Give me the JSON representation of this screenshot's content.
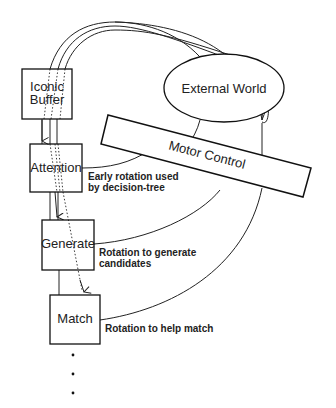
{
  "diagram": {
    "boxes": [
      {
        "id": "iconic-buffer",
        "lines": [
          "Iconic",
          "Buffer"
        ]
      },
      {
        "id": "attention",
        "label": "Attention"
      },
      {
        "id": "generate",
        "label": "Generate"
      },
      {
        "id": "match",
        "label": "Match"
      }
    ],
    "external_world": {
      "label": "External World"
    },
    "motor_control": {
      "label": "Motor Control"
    },
    "annotations": {
      "attention": [
        "Early rotation used",
        "by decision-tree"
      ],
      "generate": [
        "Rotation to generate",
        "candidates"
      ],
      "match": [
        "Rotation to help match"
      ]
    },
    "continuation": "..."
  }
}
